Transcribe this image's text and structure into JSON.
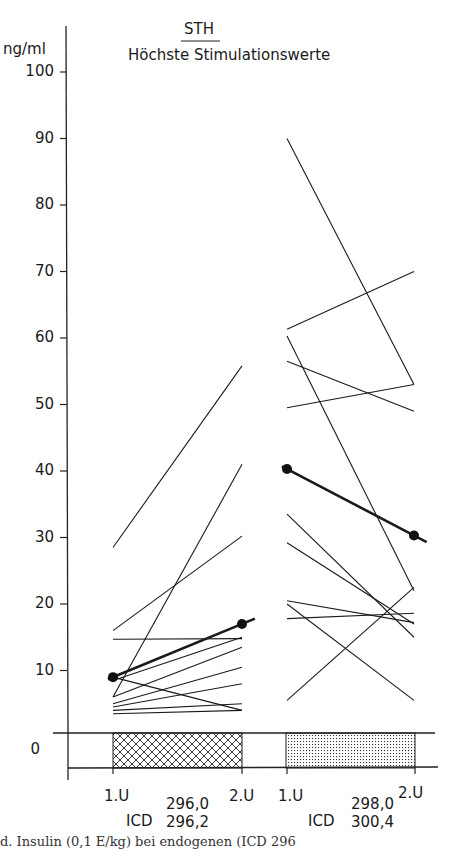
{
  "chart_data": {
    "type": "line",
    "title": "STH",
    "subtitle": "Höchste Stimulationswerte",
    "ylabel": "ng/ml",
    "xlabel": "",
    "ylim": [
      0,
      100
    ],
    "y_ticks": [
      0,
      10,
      20,
      30,
      40,
      50,
      60,
      70,
      80,
      90,
      100
    ],
    "axis_break": true,
    "grid": false,
    "legend": null,
    "groups": [
      {
        "name": "ICD 296,0 / 296,2",
        "icd_line1": "296,0",
        "icd_line2": "296,2",
        "x": [
          "1.U",
          "2.U"
        ],
        "bar_pattern": "crosshatch",
        "series": [
          {
            "name": "patient",
            "values": [
              28.5,
              55.8
            ]
          },
          {
            "name": "patient",
            "values": [
              16.0,
              30.2
            ]
          },
          {
            "name": "patient",
            "values": [
              14.7,
              14.8
            ]
          },
          {
            "name": "patient",
            "values": [
              9.0,
              4.0
            ]
          },
          {
            "name": "patient",
            "values": [
              6.0,
              41.0
            ]
          },
          {
            "name": "patient",
            "values": [
              8.5,
              15.0
            ]
          },
          {
            "name": "patient",
            "values": [
              6.0,
              13.5
            ]
          },
          {
            "name": "patient",
            "values": [
              5.0,
              10.5
            ]
          },
          {
            "name": "patient",
            "values": [
              4.5,
              8.0
            ]
          },
          {
            "name": "patient",
            "values": [
              4.0,
              5.0
            ]
          },
          {
            "name": "patient",
            "values": [
              3.5,
              4.0
            ]
          },
          {
            "name": "mean",
            "values": [
              9.0,
              17.0
            ],
            "bold": true
          }
        ]
      },
      {
        "name": "ICD 298,0 / 300,4",
        "icd_line1": "298,0",
        "icd_line2": "300,4",
        "x": [
          "1.U",
          "2.U"
        ],
        "bar_pattern": "stipple",
        "series": [
          {
            "name": "patient",
            "values": [
              90.0,
              53.0
            ]
          },
          {
            "name": "patient",
            "values": [
              61.3,
              70.0
            ]
          },
          {
            "name": "patient",
            "values": [
              60.3,
              22.0
            ]
          },
          {
            "name": "patient",
            "values": [
              56.5,
              49.0
            ]
          },
          {
            "name": "patient",
            "values": [
              49.5,
              53.0
            ]
          },
          {
            "name": "patient",
            "values": [
              33.5,
              15.0
            ]
          },
          {
            "name": "patient",
            "values": [
              29.2,
              17.0
            ]
          },
          {
            "name": "patient",
            "values": [
              20.5,
              17.2
            ]
          },
          {
            "name": "patient",
            "values": [
              17.8,
              18.6
            ]
          },
          {
            "name": "patient",
            "values": [
              20.0,
              5.5
            ]
          },
          {
            "name": "patient",
            "values": [
              5.5,
              22.5
            ]
          },
          {
            "name": "mean",
            "values": [
              40.3,
              30.3
            ],
            "bold": true
          }
        ]
      }
    ]
  },
  "labels": {
    "title": "STH",
    "subtitle": "Höchste Stimulationswerte",
    "unit": "ng/ml",
    "zero": "0",
    "ticks": [
      "100",
      "90",
      "80",
      "70",
      "60",
      "50",
      "40",
      "30",
      "20",
      "10"
    ],
    "left_x1": "1.U",
    "left_x2": "2.U",
    "right_x1": "1.U",
    "right_x2": "2.U",
    "icd": "ICD",
    "left_icd1": "296,0",
    "left_icd2": "296,2",
    "right_icd1": "298,0",
    "right_icd2": "300,4",
    "caption_fragment": "d. Insulin (0,1 E/kg) bei endogenen (ICD 296"
  }
}
